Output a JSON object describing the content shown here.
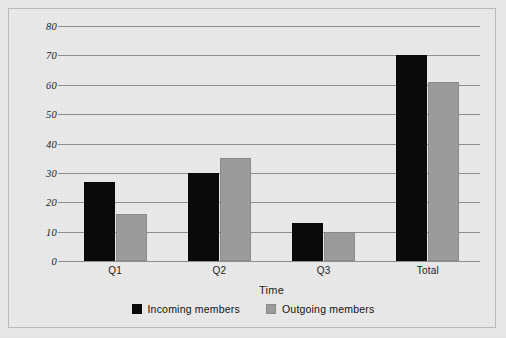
{
  "chart_data": {
    "type": "bar",
    "title": "",
    "xlabel": "Time",
    "ylabel": "Number of members",
    "categories": [
      "Q1",
      "Q2",
      "Q3",
      "Total"
    ],
    "series": [
      {
        "name": "Incoming members",
        "color": "#0a0a0a",
        "values": [
          27,
          30,
          13,
          70
        ]
      },
      {
        "name": "Outgoing members",
        "color": "#9b9b9b",
        "values": [
          16,
          35,
          10,
          61
        ]
      }
    ],
    "ylim": [
      0,
      80
    ],
    "ytick_values": [
      80,
      70,
      60,
      50,
      40,
      30,
      20,
      10,
      0
    ],
    "ytick_labels": [
      "80",
      "70",
      "60",
      "50",
      "40",
      "30",
      "20",
      "10",
      "0"
    ],
    "grid": true,
    "legend_position": "bottom"
  },
  "legend": {
    "items": [
      {
        "label": "Incoming members",
        "swatch": "incoming-swatch-icon"
      },
      {
        "label": "Outgoing members",
        "swatch": "outgoing-swatch-icon"
      }
    ]
  },
  "colors": {
    "background": "#e9e9e9",
    "frame": "#b9b9b9",
    "gridline": "#8e8e8e",
    "incoming": "#0a0a0a",
    "outgoing": "#9b9b9b",
    "text": "#1b1b1b"
  }
}
